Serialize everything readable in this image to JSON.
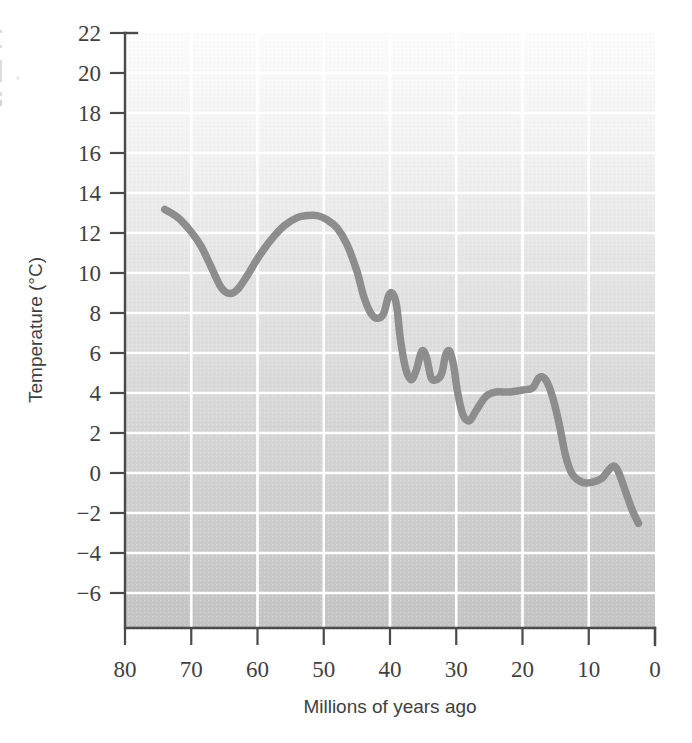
{
  "figure": {
    "background_color": "#ffffff",
    "plot_area": {
      "x": 125,
      "y": 33,
      "width": 530,
      "height": 595
    }
  },
  "chart_data": {
    "type": "line",
    "title": "",
    "subtitle": "",
    "xlabel": "Millions of years ago",
    "ylabel": "Temperature (°C)",
    "xlim": [
      80,
      0
    ],
    "ylim": [
      -7,
      22
    ],
    "x_axis_reversed": true,
    "xticks": [
      80,
      70,
      60,
      50,
      40,
      30,
      20,
      10,
      0
    ],
    "xtick_labels": [
      "80",
      "70",
      "60",
      "50",
      "40",
      "30",
      "20",
      "10",
      "0"
    ],
    "yticks": [
      22,
      20,
      18,
      16,
      14,
      12,
      10,
      8,
      6,
      4,
      2,
      0,
      -2,
      -4,
      -6
    ],
    "ytick_labels": [
      "22",
      "20",
      "18",
      "16",
      "14",
      "12",
      "10",
      "8",
      "6",
      "4",
      "2",
      "0",
      "−2",
      "−4",
      "−6"
    ],
    "grid": true,
    "grid_color": "#ffffff",
    "grid_x_values": [
      70,
      60,
      50,
      40,
      30,
      20,
      10
    ],
    "grid_y_values": [
      20,
      18,
      16,
      14,
      12,
      10,
      8,
      6,
      4,
      2,
      0,
      -2,
      -4,
      -6
    ],
    "legend": null,
    "legend_position": "none",
    "plot_background": {
      "type": "vertical-gradient",
      "top_color": "#fbfbfb",
      "bottom_color": "#c6c6c6"
    },
    "series": [
      {
        "name": "Global mean temperature",
        "color": "#8d8d8d",
        "line_width": 7.5,
        "x": [
          74.0,
          72.0,
          70.0,
          68.5,
          67.0,
          65.5,
          64.2,
          63.0,
          61.5,
          60.0,
          58.0,
          56.0,
          54.0,
          52.5,
          51.0,
          49.5,
          48.0,
          46.5,
          45.0,
          44.0,
          43.0,
          42.0,
          41.0,
          40.2,
          39.6,
          39.0,
          38.4,
          37.6,
          36.8,
          36.0,
          35.2,
          34.5,
          33.8,
          33.0,
          32.2,
          31.6,
          31.0,
          30.4,
          29.8,
          29.0,
          28.0,
          27.0,
          25.5,
          24.0,
          22.0,
          20.0,
          18.5,
          17.5,
          16.5,
          15.5,
          14.5,
          13.5,
          12.5,
          11.0,
          9.5,
          8.0,
          7.0,
          6.2,
          5.5,
          4.5,
          3.5,
          2.5
        ],
        "y": [
          13.4,
          13.0,
          12.3,
          11.6,
          10.6,
          9.6,
          9.3,
          9.5,
          10.2,
          11.0,
          11.9,
          12.6,
          13.0,
          13.1,
          13.1,
          12.9,
          12.5,
          11.7,
          10.4,
          9.2,
          8.4,
          8.1,
          8.3,
          9.2,
          9.3,
          8.7,
          7.0,
          5.6,
          5.1,
          5.6,
          6.5,
          6.2,
          5.2,
          5.1,
          5.4,
          6.3,
          6.5,
          5.8,
          4.5,
          3.4,
          3.1,
          3.6,
          4.3,
          4.5,
          4.5,
          4.6,
          4.7,
          5.2,
          5.1,
          4.3,
          3.0,
          1.4,
          0.5,
          0.1,
          0.1,
          0.3,
          0.7,
          0.9,
          0.6,
          -0.3,
          -1.2,
          -1.9
        ]
      }
    ],
    "annotations": []
  },
  "axes": {
    "y_axis_title": "Temperature (°C)",
    "x_axis_title": "Millions of years ago"
  }
}
